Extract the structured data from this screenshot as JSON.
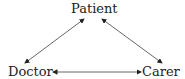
{
  "diagram": {
    "type": "triangle-relationship",
    "nodes": [
      {
        "id": "patient",
        "label": "Patient"
      },
      {
        "id": "doctor",
        "label": "Doctor"
      },
      {
        "id": "carer",
        "label": "Carer"
      }
    ],
    "edges": [
      {
        "from": "patient",
        "to": "doctor",
        "direction": "bidirectional"
      },
      {
        "from": "patient",
        "to": "carer",
        "direction": "bidirectional"
      },
      {
        "from": "doctor",
        "to": "carer",
        "direction": "bidirectional"
      }
    ],
    "colors": {
      "line": "#444444",
      "text": "#222222"
    }
  }
}
